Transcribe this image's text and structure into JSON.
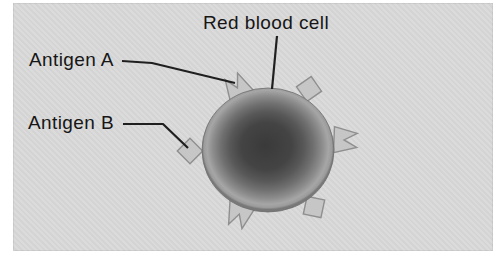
{
  "figure": {
    "labels": {
      "red_blood_cell": "Red blood cell",
      "antigen_a": "Antigen A",
      "antigen_b": "Antigen B"
    },
    "markers": {
      "antigen_a": {
        "shape": "notched-triangle",
        "count": 3
      },
      "antigen_b": {
        "shape": "diamond-square",
        "count": 3
      }
    },
    "colors": {
      "page_background": "#ffffff",
      "panel_background": "#d9d9d9",
      "text_color": "#161616",
      "leader_line": "#1f1f1f",
      "antigen_fill": "#c6c6c6",
      "antigen_stroke": "#8f8f8f",
      "cell_center": "#3a3a3a",
      "cell_mid": "#6e6e6e",
      "cell_rim": "#a6a6a6",
      "cell_edge": "#787878"
    }
  }
}
